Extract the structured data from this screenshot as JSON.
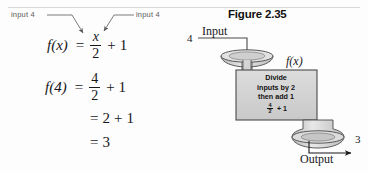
{
  "left_panel": {
    "callout_left": "input 4",
    "callout_right": "input 4",
    "equations": [
      {
        "lhs": "f(x)",
        "eq": "=",
        "numerator": "x",
        "denominator": "2",
        "op": "+",
        "addend": "1"
      },
      {
        "lhs": "f(4)",
        "eq": "=",
        "numerator": "4",
        "denominator": "2",
        "op": "+",
        "addend": "1"
      },
      {
        "eq": "=",
        "value": "2",
        "op": "+",
        "addend": "1"
      },
      {
        "eq": "=",
        "value": "3"
      }
    ]
  },
  "figure": {
    "title": "Figure 2.35",
    "input_number": "4",
    "input_label": "Input",
    "function_label": "f(x)",
    "output_label": "Output",
    "output_number": "3",
    "process_box": {
      "line1": "Divide",
      "line2": "inputs by 2",
      "line3": "then add 1",
      "frac_top": "4",
      "frac_bottom": "2",
      "frac_op": "+ 1"
    }
  },
  "colors": {
    "ink": "#17171a",
    "box_fill": "#d2d2d2",
    "box_stroke": "#4a4a4a",
    "funnel_fill": "#cfcfcf",
    "leader": "#6b6b6b",
    "page_bg": "#fdfdfd"
  }
}
